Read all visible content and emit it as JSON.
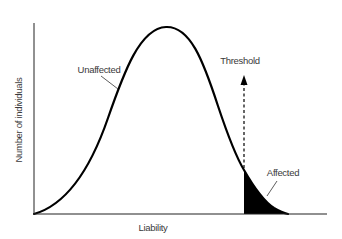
{
  "diagram": {
    "type": "liability-threshold-model",
    "axes": {
      "x_label": "Liability",
      "y_label": "Number of individuals"
    },
    "labels": {
      "unaffected": "Unaffected",
      "threshold": "Threshold",
      "affected": "Affected"
    },
    "colors": {
      "curve": "#000000",
      "affected_fill": "#000000",
      "text": "#3a3a3a",
      "background": "#ffffff"
    }
  }
}
